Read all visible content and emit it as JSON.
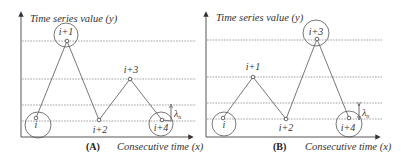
{
  "panels": [
    {
      "id": "A",
      "tag": "(A)",
      "y_axis_label": "Time series value (y)",
      "x_axis_label": "Consecutive time (x)",
      "lambda_label": "λ",
      "lambda_sub": "n",
      "points": [
        {
          "label": "i",
          "highlighted": true
        },
        {
          "label": "i+1",
          "highlighted": true
        },
        {
          "label": "i+2",
          "highlighted": false
        },
        {
          "label": "i+3",
          "highlighted": false
        },
        {
          "label": "i+4",
          "highlighted": true
        }
      ]
    },
    {
      "id": "B",
      "tag": "(B)",
      "y_axis_label": "Time series value (y)",
      "x_axis_label": "Consecutive time (x)",
      "lambda_label": "λ",
      "lambda_sub": "n",
      "points": [
        {
          "label": "i",
          "highlighted": true
        },
        {
          "label": "i+1",
          "highlighted": false
        },
        {
          "label": "i+2",
          "highlighted": false
        },
        {
          "label": "i+3",
          "highlighted": true
        },
        {
          "label": "i+4",
          "highlighted": true
        }
      ]
    }
  ]
}
